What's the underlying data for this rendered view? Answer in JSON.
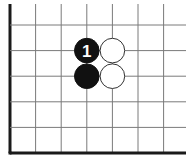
{
  "diagram": {
    "type": "go-board-corner",
    "visible_columns": 7,
    "visible_rows": 6,
    "edges": [
      "left",
      "bottom"
    ],
    "stones": [
      {
        "color": "black",
        "col": 3,
        "row": 1,
        "label": "1"
      },
      {
        "color": "black",
        "col": 3,
        "row": 2,
        "label": ""
      },
      {
        "color": "white",
        "col": 4,
        "row": 1,
        "label": ""
      },
      {
        "color": "white",
        "col": 4,
        "row": 2,
        "label": ""
      }
    ],
    "colors": {
      "black_stone": "#111111",
      "white_stone": "#ffffff",
      "grid": "#7a7a7a",
      "edge": "#1a1a1a"
    }
  }
}
